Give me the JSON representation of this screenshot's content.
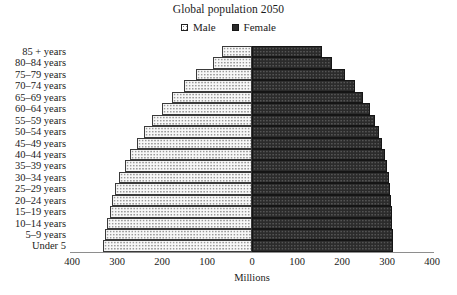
{
  "chart_data": {
    "type": "bar",
    "title": "Global population 2050",
    "subtitle": "",
    "xlabel": "Millions",
    "ylabel": "",
    "orientation": "horizontal",
    "style": "population-pyramid",
    "grid": false,
    "legend_position": "top-center",
    "xlim": [
      -400,
      400
    ],
    "xticks": [
      400,
      300,
      200,
      100,
      0,
      100,
      200,
      300,
      400
    ],
    "xtick_labels": [
      "400",
      "300",
      "200",
      "100",
      "0",
      "100",
      "200",
      "300",
      "400"
    ],
    "axis_max": 400,
    "categories": [
      "85 + years",
      "80–84 years",
      "75–79 years",
      "70–74 years",
      "65–69 years",
      "60–64 years",
      "55–59 years",
      "50–54 years",
      "45–49 years",
      "40–44 years",
      "35–39 years",
      "30–34 years",
      "25–29 years",
      "20–24 years",
      "15–19 years",
      "10–14 years",
      "5–9 years",
      "Under 5"
    ],
    "series": [
      {
        "name": "Male",
        "side": "left",
        "color": "#f7f7f7",
        "values": [
          67,
          87,
          124,
          151,
          178,
          200,
          222,
          240,
          256,
          271,
          282,
          296,
          304,
          311,
          316,
          322,
          327,
          331
        ]
      },
      {
        "name": "Female",
        "side": "right",
        "color": "#2b2b2b",
        "values": [
          156,
          178,
          207,
          229,
          247,
          262,
          273,
          282,
          289,
          296,
          300,
          304,
          307,
          309,
          311,
          311,
          313,
          313
        ]
      }
    ]
  },
  "legend": {
    "entries": [
      {
        "label": "Male",
        "swatch": "male-swatch-icon"
      },
      {
        "label": "Female",
        "swatch": "female-swatch-icon"
      }
    ]
  },
  "colors": {
    "male_fill": "#f7f7f7",
    "female_fill": "#2b2b2b",
    "bar_border": "#3a3a3a",
    "axis": "#8e8e8e",
    "text": "#1a1a1a",
    "background": "#ffffff"
  }
}
